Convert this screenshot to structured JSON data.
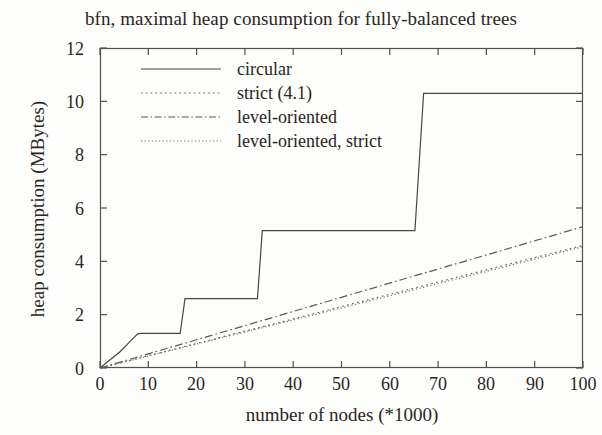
{
  "chart_data": {
    "type": "line",
    "title": "bfn, maximal heap consumption for fully-balanced trees",
    "xlabel": "number of nodes (*1000)",
    "ylabel": "heap consumption (MBytes)",
    "xlim": [
      0,
      100
    ],
    "ylim": [
      0,
      12
    ],
    "xticks": [
      "0",
      "10",
      "20",
      "30",
      "40",
      "50",
      "60",
      "70",
      "80",
      "90",
      "100"
    ],
    "yticks": [
      "0",
      "2",
      "4",
      "6",
      "8",
      "10",
      "12"
    ],
    "grid": false,
    "legend_position": "upper left inside",
    "series": [
      {
        "name": "circular",
        "style": "solid",
        "shape": "step",
        "points": [
          [
            0,
            0
          ],
          [
            4.2,
            0.62
          ],
          [
            6.0,
            0.95
          ],
          [
            7.8,
            1.28
          ],
          [
            8.4,
            1.3
          ],
          [
            16.6,
            1.3
          ],
          [
            17.6,
            2.6
          ],
          [
            32.6,
            2.6
          ],
          [
            33.6,
            5.15
          ],
          [
            65.2,
            5.15
          ],
          [
            67.0,
            10.3
          ],
          [
            100,
            10.3
          ]
        ]
      },
      {
        "name": "strict (4.1)",
        "style": "dotted",
        "shape": "linear",
        "points": [
          [
            0,
            0
          ],
          [
            20,
            0.92
          ],
          [
            40,
            1.84
          ],
          [
            62,
            2.86
          ],
          [
            80,
            3.68
          ],
          [
            100,
            4.6
          ]
        ]
      },
      {
        "name": "level-oriented",
        "style": "dash-dot",
        "shape": "linear",
        "points": [
          [
            0,
            0
          ],
          [
            20,
            1.06
          ],
          [
            40,
            2.12
          ],
          [
            62,
            3.29
          ],
          [
            80,
            4.24
          ],
          [
            100,
            5.3
          ]
        ]
      },
      {
        "name": "level-oriented, strict",
        "style": "fine-dotted",
        "shape": "linear",
        "points": [
          [
            0,
            0
          ],
          [
            20,
            0.9
          ],
          [
            40,
            1.8
          ],
          [
            62,
            2.8
          ],
          [
            80,
            3.62
          ],
          [
            100,
            4.55
          ]
        ]
      }
    ]
  },
  "legend": {
    "items": [
      {
        "label": "circular",
        "style": "solid"
      },
      {
        "label": "strict (4.1)",
        "style": "dotted"
      },
      {
        "label": "level-oriented",
        "style": "dash-dot"
      },
      {
        "label": "level-oriented, strict",
        "style": "fine-dotted"
      }
    ]
  },
  "colors": {
    "ink": "#2a2623",
    "line": "#4a4643",
    "background": "#fdfdfc"
  }
}
